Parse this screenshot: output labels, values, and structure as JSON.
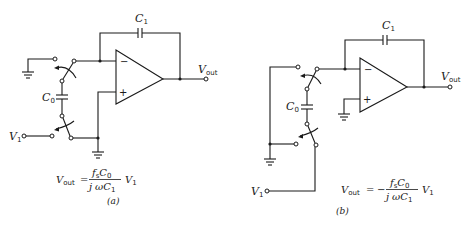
{
  "diagrams": [
    {
      "id": "a",
      "caption": "(a)",
      "feedback_capacitor": {
        "name": "C",
        "sub": "1"
      },
      "sampling_capacitor": {
        "name": "C",
        "sub": "0"
      },
      "output": {
        "name": "V",
        "sub": "out"
      },
      "input": {
        "name": "V",
        "sub": "1"
      },
      "opamp": {
        "inverting": "−",
        "noninverting": "+"
      },
      "formula": {
        "lhs_name": "V",
        "lhs_sub": "out",
        "equals": "=",
        "sign": "",
        "numerator": "fₛC₀",
        "num_f": "f",
        "num_fsub": "s",
        "num_c": "C",
        "num_csub": "0",
        "den_j": "j",
        "den_w": "ω",
        "den_c": "C",
        "den_csub": "1",
        "rhs_name": "V",
        "rhs_sub": "1"
      }
    },
    {
      "id": "b",
      "caption": "(b)",
      "feedback_capacitor": {
        "name": "C",
        "sub": "1"
      },
      "sampling_capacitor": {
        "name": "C",
        "sub": "0"
      },
      "output": {
        "name": "V",
        "sub": "out"
      },
      "input": {
        "name": "V",
        "sub": "1"
      },
      "opamp": {
        "inverting": "−",
        "noninverting": "+"
      },
      "formula": {
        "lhs_name": "V",
        "lhs_sub": "out",
        "equals": "=",
        "sign": "−",
        "num_f": "f",
        "num_fsub": "s",
        "num_c": "C",
        "num_csub": "0",
        "den_j": "j",
        "den_w": "ω",
        "den_c": "C",
        "den_csub": "1",
        "rhs_name": "V",
        "rhs_sub": "1"
      }
    }
  ]
}
